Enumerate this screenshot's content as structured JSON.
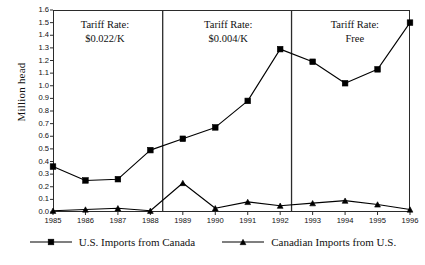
{
  "chart_data": {
    "type": "line",
    "title": "",
    "xlabel": "",
    "ylabel": "Million head",
    "x": [
      1985,
      1986,
      1987,
      1988,
      1989,
      1990,
      1991,
      1992,
      1993,
      1994,
      1995,
      1996
    ],
    "xlim": [
      1985,
      1996
    ],
    "ylim": [
      0.0,
      1.6
    ],
    "ytick_labels": [
      "1.6",
      "1.5",
      "1.4",
      "1.3",
      "1.2",
      "1.1",
      "1.0",
      "0.9",
      "0.8",
      "0.7",
      "0.6",
      "0.5",
      "0.4",
      "0.3",
      "0.2",
      "0.1",
      "0.0"
    ],
    "ytick_values": [
      1.6,
      1.5,
      1.4,
      1.3,
      1.2,
      1.1,
      1.0,
      0.9,
      0.8,
      0.7,
      0.6,
      0.5,
      0.4,
      0.3,
      0.2,
      0.1,
      0.0
    ],
    "xtick_labels": [
      "1985",
      "1986",
      "1987",
      "1988",
      "1989",
      "1990",
      "1991",
      "1992",
      "1993",
      "1994",
      "1995",
      "1996"
    ],
    "grid": false,
    "legend_position": "bottom",
    "series": [
      {
        "name": "U.S. Imports from Canada",
        "marker": "square",
        "color": "#000000",
        "values": [
          0.36,
          0.25,
          0.26,
          0.49,
          0.58,
          0.67,
          0.88,
          1.29,
          1.19,
          1.02,
          1.13,
          1.5
        ]
      },
      {
        "name": "Canadian Imports from U.S.",
        "marker": "triangle",
        "color": "#000000",
        "values": [
          0.01,
          0.02,
          0.03,
          0.01,
          0.23,
          0.03,
          0.08,
          0.05,
          0.07,
          0.09,
          0.06,
          0.02
        ]
      }
    ],
    "annotations": [
      {
        "line1": "Tariff Rate:",
        "line2": "$0.022/K",
        "x_center": 1986.6,
        "y": 1.47
      },
      {
        "line1": "Tariff Rate:",
        "line2": "$0.004/K",
        "x_center": 1990.4,
        "y": 1.47
      },
      {
        "line1": "Tariff Rate:",
        "line2": "Free",
        "x_center": 1994.3,
        "y": 1.47
      }
    ],
    "dividers": [
      {
        "x": 1988.38,
        "label": "tariff-divider-1"
      },
      {
        "x": 1992.35,
        "label": "tariff-divider-2"
      }
    ]
  }
}
